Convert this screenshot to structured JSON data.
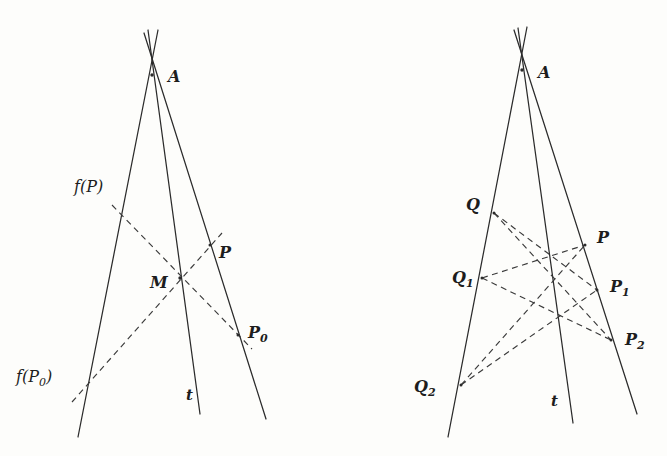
{
  "figure": {
    "background_color": "#fdfdfb",
    "stroke_color": "#2b2b2b",
    "panels": [
      {
        "id": "left-panel",
        "name": "left-diagram",
        "apex_label": "A",
        "axis_label": "t",
        "labels": [
          {
            "key": "A",
            "text": "A",
            "sub": "",
            "x": 168,
            "y": 82,
            "style": "bold-italic"
          },
          {
            "key": "fP",
            "text": "f(P)",
            "sub": "",
            "x": 74,
            "y": 192,
            "style": "italic"
          },
          {
            "key": "M",
            "text": "M",
            "sub": "",
            "x": 150,
            "y": 288,
            "style": "bold-italic"
          },
          {
            "key": "P",
            "text": "P",
            "sub": "",
            "x": 219,
            "y": 258,
            "style": "bold-italic"
          },
          {
            "key": "P0",
            "text": "P",
            "sub": "0",
            "x": 248,
            "y": 338,
            "style": "bold-italic"
          },
          {
            "key": "fP0",
            "text": "f(P",
            "sub": "0",
            "x": 16,
            "y": 382,
            "style": "italic",
            "suffix": ")"
          },
          {
            "key": "t",
            "text": "t",
            "sub": "",
            "x": 186,
            "y": 400,
            "style": "bold-italic-small"
          }
        ],
        "points": [
          {
            "key": "A",
            "x": 152,
            "y": 75
          },
          {
            "key": "M",
            "x": 180,
            "y": 278
          },
          {
            "key": "P",
            "x": 210,
            "y": 245
          },
          {
            "key": "P0",
            "x": 238,
            "y": 335
          }
        ],
        "solid_lines": [
          {
            "key": "left-ray",
            "x1": 158,
            "y1": 30,
            "x2": 78,
            "y2": 437
          },
          {
            "key": "mid-ray-t",
            "x1": 148,
            "y1": 30,
            "x2": 200,
            "y2": 414
          },
          {
            "key": "right-ray",
            "x1": 144,
            "y1": 33,
            "x2": 266,
            "y2": 419
          }
        ],
        "dashed_lines": [
          {
            "key": "fP-to-P0",
            "x1": 112,
            "y1": 205,
            "x2": 252,
            "y2": 349
          },
          {
            "key": "fP0-to-P",
            "x1": 72,
            "y1": 402,
            "x2": 222,
            "y2": 233
          }
        ]
      },
      {
        "id": "right-panel",
        "name": "right-diagram",
        "apex_label": "A",
        "axis_label": "t",
        "labels": [
          {
            "key": "A",
            "text": "A",
            "sub": "",
            "x": 538,
            "y": 78,
            "style": "bold-italic"
          },
          {
            "key": "Q",
            "text": "Q",
            "sub": "",
            "x": 466,
            "y": 210,
            "style": "bold-italic"
          },
          {
            "key": "Q1",
            "text": "Q",
            "sub": "1",
            "x": 452,
            "y": 283,
            "style": "bold-italic"
          },
          {
            "key": "Q2",
            "text": "Q",
            "sub": "2",
            "x": 414,
            "y": 392,
            "style": "bold-italic"
          },
          {
            "key": "P",
            "text": "P",
            "sub": "",
            "x": 597,
            "y": 243,
            "style": "bold-italic"
          },
          {
            "key": "P1",
            "text": "P",
            "sub": "1",
            "x": 610,
            "y": 292,
            "style": "bold-italic"
          },
          {
            "key": "P2",
            "text": "P",
            "sub": "2",
            "x": 625,
            "y": 345,
            "style": "bold-italic"
          },
          {
            "key": "t",
            "text": "t",
            "sub": "",
            "x": 551,
            "y": 406,
            "style": "bold-italic-small"
          }
        ],
        "points": [
          {
            "key": "A",
            "x": 522,
            "y": 70
          },
          {
            "key": "Q",
            "x": 494,
            "y": 213
          },
          {
            "key": "Q1",
            "x": 482,
            "y": 278
          },
          {
            "key": "Q2",
            "x": 461,
            "y": 385
          },
          {
            "key": "P",
            "x": 585,
            "y": 245
          },
          {
            "key": "P1",
            "x": 597,
            "y": 290
          },
          {
            "key": "P2",
            "x": 611,
            "y": 340
          }
        ],
        "solid_lines": [
          {
            "key": "left-ray",
            "x1": 527,
            "y1": 27,
            "x2": 448,
            "y2": 437
          },
          {
            "key": "mid-ray-t",
            "x1": 518,
            "y1": 28,
            "x2": 573,
            "y2": 423
          },
          {
            "key": "right-ray",
            "x1": 514,
            "y1": 30,
            "x2": 637,
            "y2": 414
          }
        ],
        "dashed_lines": [
          {
            "key": "Q-to-P1",
            "x1": 494,
            "y1": 213,
            "x2": 597,
            "y2": 290
          },
          {
            "key": "Q-to-P2",
            "x1": 494,
            "y1": 213,
            "x2": 611,
            "y2": 340
          },
          {
            "key": "Q1-to-P",
            "x1": 482,
            "y1": 278,
            "x2": 585,
            "y2": 245
          },
          {
            "key": "Q1-to-P2",
            "x1": 482,
            "y1": 278,
            "x2": 611,
            "y2": 340
          },
          {
            "key": "Q2-to-P",
            "x1": 461,
            "y1": 385,
            "x2": 585,
            "y2": 245
          },
          {
            "key": "Q2-to-P1",
            "x1": 461,
            "y1": 385,
            "x2": 597,
            "y2": 290
          }
        ]
      }
    ]
  }
}
